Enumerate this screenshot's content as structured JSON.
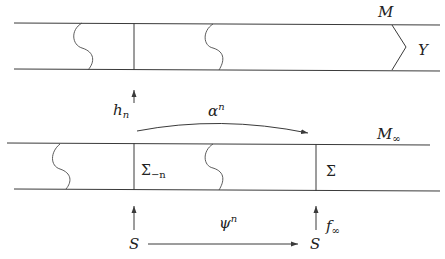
{
  "diagram": {
    "top_strip": {
      "label": "M",
      "end_label": "Y"
    },
    "bottom_strip": {
      "label_base": "M",
      "label_sub": "∞",
      "left_section_base": "Σ",
      "left_section_sub": "−n",
      "right_section": "Σ"
    },
    "arrows": {
      "h": {
        "base": "h",
        "sub": "n"
      },
      "alpha": {
        "base": "α",
        "sup": "n"
      },
      "psi": {
        "base": "ψ",
        "sup": "n"
      },
      "f": {
        "base": "f",
        "sub": "∞"
      }
    },
    "base_nodes": {
      "left": "S",
      "right": "S"
    }
  }
}
